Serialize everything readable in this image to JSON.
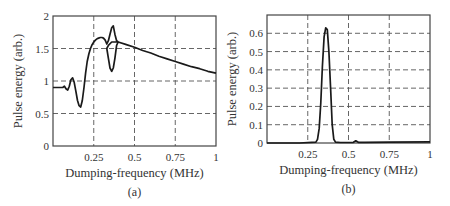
{
  "chart_data": [
    {
      "id": "a",
      "type": "line",
      "panel_label": "(a)",
      "title": "",
      "xlabel": "Dumping-frequency (MHz)",
      "ylabel": "Pulse energy (arb.)",
      "xlim": [
        0,
        1
      ],
      "ylim": [
        0,
        2
      ],
      "xticks": [
        0.25,
        0.5,
        0.75,
        1
      ],
      "xtick_labels": [
        "0.25",
        "0.5",
        "0.75",
        "1"
      ],
      "yticks": [
        0,
        0.5,
        1,
        1.5,
        2
      ],
      "ytick_labels": [
        "0",
        "0.5",
        "1",
        "1.5",
        "2"
      ],
      "grid": true,
      "legend": null,
      "series": [
        {
          "name": "pulse energy",
          "x": [
            0.0,
            0.06,
            0.07,
            0.08,
            0.09,
            0.1,
            0.11,
            0.12,
            0.13,
            0.14,
            0.15,
            0.16,
            0.17,
            0.18,
            0.19,
            0.2,
            0.21,
            0.22,
            0.23,
            0.24,
            0.25,
            0.26,
            0.27,
            0.28,
            0.29,
            0.3,
            0.31,
            0.32,
            0.33,
            0.34,
            0.35,
            0.36,
            0.37,
            0.38,
            0.39,
            0.4,
            0.39,
            0.38,
            0.37,
            0.36,
            0.35,
            0.34,
            0.33,
            0.34,
            0.36,
            0.38,
            0.4,
            0.45,
            0.5,
            0.55,
            0.6,
            0.65,
            0.7,
            0.75,
            0.8,
            0.85,
            0.9,
            0.95,
            1.0
          ],
          "y": [
            0.9,
            0.9,
            0.92,
            0.88,
            0.86,
            0.92,
            1.02,
            1.05,
            0.98,
            0.85,
            0.7,
            0.62,
            0.6,
            0.7,
            0.9,
            1.12,
            1.3,
            1.42,
            1.5,
            1.56,
            1.6,
            1.63,
            1.65,
            1.66,
            1.67,
            1.67,
            1.66,
            1.63,
            1.57,
            1.62,
            1.72,
            1.82,
            1.85,
            1.72,
            1.62,
            1.6,
            1.55,
            1.35,
            1.2,
            1.15,
            1.2,
            1.35,
            1.5,
            1.55,
            1.6,
            1.6,
            1.6,
            1.56,
            1.52,
            1.47,
            1.43,
            1.38,
            1.34,
            1.3,
            1.26,
            1.22,
            1.19,
            1.15,
            1.12
          ]
        }
      ]
    },
    {
      "id": "b",
      "type": "line",
      "panel_label": "(b)",
      "title": "",
      "xlabel": "Dumping-frequency (MHz)",
      "ylabel": "Pulse energy (arb.)",
      "xlim": [
        0,
        1
      ],
      "ylim": [
        0,
        0.7
      ],
      "xticks": [
        0.25,
        0.5,
        0.75,
        1
      ],
      "xtick_labels": [
        "0.25",
        "0.5",
        "0.75",
        "1"
      ],
      "yticks": [
        0,
        0.1,
        0.2,
        0.3,
        0.4,
        0.5,
        0.6
      ],
      "ytick_labels": [
        "0",
        "0.1",
        "0.2",
        "0.3",
        "0.4",
        "0.5",
        "0.6"
      ],
      "grid": true,
      "legend": null,
      "series": [
        {
          "name": "pulse energy",
          "x": [
            0.0,
            0.2,
            0.3,
            0.31,
            0.32,
            0.33,
            0.34,
            0.35,
            0.36,
            0.37,
            0.38,
            0.39,
            0.4,
            0.41,
            0.42,
            0.45,
            0.5,
            0.53,
            0.545,
            0.56,
            0.6,
            0.75,
            1.0
          ],
          "y": [
            0.0,
            0.0,
            0.005,
            0.02,
            0.08,
            0.22,
            0.42,
            0.58,
            0.63,
            0.62,
            0.5,
            0.3,
            0.1,
            0.02,
            0.005,
            0.003,
            0.003,
            0.004,
            0.012,
            0.004,
            0.004,
            0.005,
            0.006
          ]
        }
      ]
    }
  ],
  "layout": {
    "plots": [
      {
        "left": 53,
        "top": 16,
        "right": 216,
        "bottom": 146
      },
      {
        "left": 267,
        "top": 15,
        "right": 430,
        "bottom": 143
      }
    ]
  }
}
